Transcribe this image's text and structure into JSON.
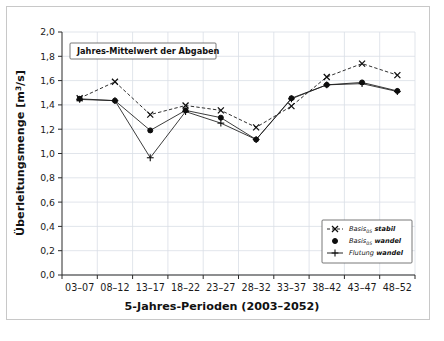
{
  "chart_data": {
    "type": "line",
    "title": "Jahres-Mittelwert der Abgaben",
    "xlabel": "5-Jahres-Perioden (2003–2052)",
    "ylabel": "Überleitungsmenge [m³/s]",
    "categories": [
      "03–07",
      "08–12",
      "13–17",
      "18–22",
      "23–27",
      "28–32",
      "33–37",
      "38–42",
      "43–47",
      "48–52"
    ],
    "ylim": [
      0.0,
      2.0
    ],
    "ytick_values": [
      0.0,
      0.2,
      0.4,
      0.6,
      0.8,
      1.0,
      1.2,
      1.4,
      1.6,
      1.8,
      2.0
    ],
    "ytick_labels": [
      "0,0",
      "0,2",
      "0,4",
      "0,6",
      "0,8",
      "1,0",
      "1,2",
      "1,4",
      "1,6",
      "1,8",
      "2,0"
    ],
    "grid": true,
    "legend_position": "lower-right",
    "series": [
      {
        "name": "Basis05 stabil",
        "name_main": "Basis",
        "name_sub": "05",
        "name_tail": "stabil",
        "marker": "x",
        "linestyle": "dashed",
        "color": "#0d0d0d",
        "values": [
          1.455,
          1.59,
          1.32,
          1.395,
          1.355,
          1.215,
          1.39,
          1.63,
          1.74,
          1.645
        ]
      },
      {
        "name": "Basis05 wandel",
        "name_main": "Basis",
        "name_sub": "05",
        "name_tail": "wandel",
        "marker": "circle",
        "linestyle": "solid",
        "color": "#0d0d0d",
        "values": [
          1.45,
          1.435,
          1.19,
          1.355,
          1.295,
          1.115,
          1.455,
          1.565,
          1.585,
          1.515
        ]
      },
      {
        "name": "Flutung wandel",
        "name_main": "Flutung",
        "name_sub": "",
        "name_tail": "wandel",
        "marker": "plus",
        "linestyle": "solid",
        "color": "#0d0d0d",
        "values": [
          1.445,
          1.435,
          0.965,
          1.345,
          1.25,
          1.115,
          1.45,
          1.565,
          1.575,
          1.51
        ]
      }
    ]
  }
}
